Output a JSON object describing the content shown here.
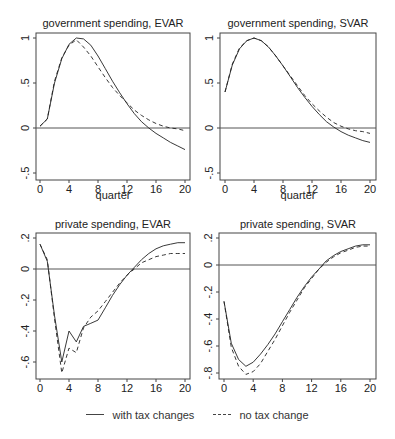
{
  "chart_data": [
    {
      "type": "line",
      "title": "government spending, EVAR",
      "xlabel": "quarter",
      "ylabel": "",
      "xlim": [
        0,
        20
      ],
      "ylim": [
        -0.55,
        1.05
      ],
      "xticks": [
        0,
        4,
        8,
        12,
        16,
        20
      ],
      "yticks": [
        -0.5,
        0,
        0.5,
        1
      ],
      "ytick_labels": [
        "-.5",
        "0",
        ".5",
        "1"
      ],
      "hline": 0,
      "x": [
        0,
        1,
        2,
        3,
        4,
        5,
        6,
        7,
        8,
        9,
        10,
        11,
        12,
        13,
        14,
        15,
        16,
        17,
        18,
        19,
        20
      ],
      "series": [
        {
          "name": "with tax changes",
          "style": "solid",
          "values": [
            0.02,
            0.1,
            0.5,
            0.77,
            0.93,
            1.0,
            0.99,
            0.92,
            0.8,
            0.66,
            0.52,
            0.39,
            0.27,
            0.16,
            0.07,
            0.0,
            -0.06,
            -0.11,
            -0.16,
            -0.2,
            -0.24
          ]
        },
        {
          "name": "no tax change",
          "style": "dashed",
          "values": [
            0.02,
            0.1,
            0.52,
            0.78,
            0.92,
            0.98,
            0.9,
            0.8,
            0.68,
            0.56,
            0.45,
            0.36,
            0.28,
            0.2,
            0.14,
            0.09,
            0.05,
            0.02,
            0.0,
            -0.01,
            -0.03
          ]
        }
      ]
    },
    {
      "type": "line",
      "title": "government spending, SVAR",
      "xlabel": "quarter",
      "ylabel": "",
      "xlim": [
        0,
        20
      ],
      "ylim": [
        -0.55,
        1.05
      ],
      "xticks": [
        0,
        4,
        8,
        12,
        16,
        20
      ],
      "yticks": [
        -0.5,
        0,
        0.5,
        1
      ],
      "ytick_labels": [
        "-.5",
        "0",
        ".5",
        "1"
      ],
      "hline": 0,
      "x": [
        0,
        1,
        2,
        3,
        4,
        5,
        6,
        7,
        8,
        9,
        10,
        11,
        12,
        13,
        14,
        15,
        16,
        17,
        18,
        19,
        20
      ],
      "series": [
        {
          "name": "with tax changes",
          "style": "solid",
          "values": [
            0.4,
            0.7,
            0.88,
            0.97,
            1.0,
            0.97,
            0.9,
            0.8,
            0.69,
            0.57,
            0.45,
            0.34,
            0.24,
            0.15,
            0.07,
            0.01,
            -0.04,
            -0.08,
            -0.11,
            -0.14,
            -0.16
          ]
        },
        {
          "name": "no tax change",
          "style": "dashed",
          "values": [
            0.4,
            0.71,
            0.89,
            0.97,
            1.0,
            0.97,
            0.9,
            0.8,
            0.69,
            0.58,
            0.47,
            0.36,
            0.27,
            0.19,
            0.12,
            0.06,
            0.02,
            -0.01,
            -0.03,
            -0.04,
            -0.06
          ]
        }
      ]
    },
    {
      "type": "line",
      "title": "private spending, EVAR",
      "xlabel": "quarter",
      "ylabel": "",
      "xlim": [
        0,
        20
      ],
      "ylim": [
        -0.7,
        0.23
      ],
      "xticks": [
        0,
        4,
        8,
        12,
        16,
        20
      ],
      "yticks": [
        -0.6,
        -0.4,
        -0.2,
        0,
        0.2
      ],
      "ytick_labels": [
        "-.6",
        "-.4",
        "-.2",
        "0",
        ".2"
      ],
      "hline": 0,
      "x": [
        0,
        1,
        2,
        3,
        4,
        5,
        6,
        7,
        8,
        9,
        10,
        11,
        12,
        13,
        14,
        15,
        16,
        17,
        18,
        19,
        20
      ],
      "series": [
        {
          "name": "with tax changes",
          "style": "solid",
          "values": [
            0.16,
            0.05,
            -0.3,
            -0.6,
            -0.4,
            -0.47,
            -0.37,
            -0.35,
            -0.33,
            -0.25,
            -0.17,
            -0.1,
            -0.04,
            0.01,
            0.06,
            0.1,
            0.13,
            0.15,
            0.16,
            0.17,
            0.17
          ]
        },
        {
          "name": "no tax change",
          "style": "dashed",
          "values": [
            0.16,
            0.06,
            -0.32,
            -0.67,
            -0.51,
            -0.54,
            -0.38,
            -0.31,
            -0.27,
            -0.21,
            -0.15,
            -0.09,
            -0.04,
            0.0,
            0.04,
            0.06,
            0.08,
            0.09,
            0.1,
            0.1,
            0.1
          ]
        }
      ]
    },
    {
      "type": "line",
      "title": "private spending, SVAR",
      "xlabel": "quarter",
      "ylabel": "",
      "xlim": [
        0,
        20
      ],
      "ylim": [
        -0.85,
        0.23
      ],
      "xticks": [
        0,
        4,
        8,
        12,
        16,
        20
      ],
      "yticks": [
        -0.8,
        -0.6,
        -0.4,
        -0.2,
        0,
        0.2
      ],
      "ytick_labels": [
        "-.8",
        "-.6",
        "-.4",
        "-.2",
        "0",
        ".2"
      ],
      "hline": 0,
      "x": [
        0,
        1,
        2,
        3,
        4,
        5,
        6,
        7,
        8,
        9,
        10,
        11,
        12,
        13,
        14,
        15,
        16,
        17,
        18,
        19,
        20
      ],
      "series": [
        {
          "name": "with tax changes",
          "style": "solid",
          "values": [
            -0.27,
            -0.58,
            -0.7,
            -0.75,
            -0.72,
            -0.66,
            -0.59,
            -0.51,
            -0.42,
            -0.33,
            -0.24,
            -0.16,
            -0.09,
            -0.03,
            0.03,
            0.07,
            0.1,
            0.12,
            0.14,
            0.15,
            0.15
          ]
        },
        {
          "name": "no tax change",
          "style": "dashed",
          "values": [
            -0.27,
            -0.61,
            -0.75,
            -0.81,
            -0.79,
            -0.73,
            -0.64,
            -0.55,
            -0.45,
            -0.35,
            -0.26,
            -0.17,
            -0.1,
            -0.03,
            0.02,
            0.06,
            0.09,
            0.11,
            0.13,
            0.14,
            0.14
          ]
        }
      ]
    }
  ],
  "panels": [
    {
      "title": "government spending, EVAR",
      "xlabel": "quarter"
    },
    {
      "title": "government spending, SVAR",
      "xlabel": "quarter"
    },
    {
      "title": "private spending, EVAR",
      "xlabel": "quarter"
    },
    {
      "title": "private spending, SVAR",
      "xlabel": "quarter"
    }
  ],
  "legend": {
    "items": [
      {
        "label": "with tax changes",
        "style": "solid"
      },
      {
        "label": "no tax change",
        "style": "dashed"
      }
    ]
  },
  "colors": {
    "line": "#222222",
    "frame": "#444444",
    "zero_line": "#555555"
  }
}
